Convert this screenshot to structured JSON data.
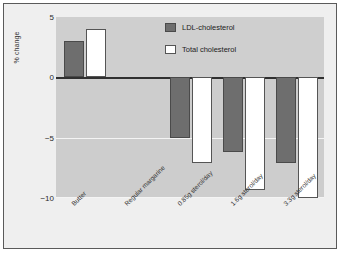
{
  "chart_data": {
    "type": "bar",
    "title": "",
    "subtitle": "",
    "xlabel": "",
    "ylabel": "% change",
    "ylim": [
      -10,
      5
    ],
    "yticks": [
      5,
      0,
      -5,
      -10
    ],
    "ytick_labels": [
      "5",
      "0",
      "−5",
      "−10"
    ],
    "grid": true,
    "zero_line": true,
    "legend_position": "top-right",
    "categories": [
      "Butter",
      "Regular margarine",
      "0.85g sterol/day",
      "1.6g sterol/day",
      "3.3g sterol/day"
    ],
    "series": [
      {
        "name": "LDL-cholesterol",
        "color": "#6e6e6e",
        "values": [
          3.0,
          0.0,
          -5.0,
          -6.2,
          -7.1
        ]
      },
      {
        "name": "Total cholesterol",
        "color": "#ffffff",
        "values": [
          4.0,
          0.0,
          -7.1,
          -9.3,
          -10.0
        ]
      }
    ]
  },
  "legend": {
    "items": [
      {
        "label": "LDL-cholesterol",
        "swatch": "dark-gray-swatch"
      },
      {
        "label": "Total cholesterol",
        "swatch": "white-swatch"
      }
    ]
  },
  "axes": {
    "y_title": "% change",
    "y_tick_labels": [
      "5",
      "0",
      "−5",
      "−10"
    ],
    "x_tick_labels": [
      "Butter",
      "Regular margarine",
      "0.85g sterol/day",
      "1.6g sterol/day",
      "3.3g sterol/day"
    ]
  },
  "colors": {
    "plot_background": "#cdcdcd",
    "figure_background": "#efefef",
    "frame_border": "#5a5a5a",
    "gridline": "#f4f4f4",
    "zero_line": "#303030",
    "ldl_series": "#6e6e6e",
    "total_series": "#ffffff"
  }
}
